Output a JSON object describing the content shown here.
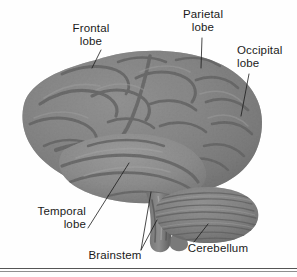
{
  "figure": {
    "background_color": "#fefefe",
    "ink_color": "#1a1a1a",
    "rule_color": "#555555"
  },
  "labels": [
    {
      "id": "frontal",
      "text": "Frontal\nlobe",
      "align": "center",
      "leader": "diagonal-down-right"
    },
    {
      "id": "parietal",
      "text": "Parietal\nlobe",
      "align": "center",
      "leader": "vertical-down"
    },
    {
      "id": "occipital",
      "text": "Occipital\nlobe",
      "align": "left",
      "leader": "diagonal-down-left"
    },
    {
      "id": "temporal",
      "text": "Temporal\nlobe",
      "align": "right",
      "leader": "diagonal-up-right"
    },
    {
      "id": "brainstem",
      "text": "Brainstem",
      "align": "center",
      "leader": "two-fanned-up-right"
    },
    {
      "id": "cerebellum",
      "text": "Cerebellum",
      "align": "center",
      "leader": "diagonal-up-right"
    }
  ],
  "structures": [
    {
      "name": "frontal-lobe",
      "region": "anterior-superior"
    },
    {
      "name": "parietal-lobe",
      "region": "posterior-superior"
    },
    {
      "name": "occipital-lobe",
      "region": "posterior"
    },
    {
      "name": "temporal-lobe",
      "region": "inferior-lateral"
    },
    {
      "name": "cerebellum",
      "region": "postero-inferior"
    },
    {
      "name": "brainstem",
      "region": "inferior-medial"
    }
  ]
}
